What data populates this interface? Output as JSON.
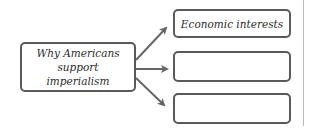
{
  "diagram": {
    "type": "concept-web",
    "central_node": {
      "label": "Why Americans support imperialism",
      "line1": "Why Americans",
      "line2": "support imperialism"
    },
    "branches": [
      {
        "label": "Economic interests"
      },
      {
        "label": ""
      },
      {
        "label": ""
      }
    ],
    "colors": {
      "border": "#5a5a5a",
      "text": "#2c2c2c",
      "arrow": "#666666",
      "divider": "#b9b9b9"
    }
  }
}
